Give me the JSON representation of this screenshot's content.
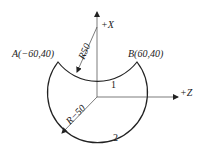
{
  "diagram": {
    "axes": {
      "x_label": "+X",
      "z_label": "+Z"
    },
    "points": {
      "A": "A(−60,40)",
      "B": "B(60,40)"
    },
    "radii": {
      "concave": "R50",
      "convex": "R−50"
    },
    "segments": {
      "seg1": "1",
      "seg2": "2"
    },
    "colors": {
      "stroke": "#222222",
      "background": "#ffffff"
    }
  }
}
